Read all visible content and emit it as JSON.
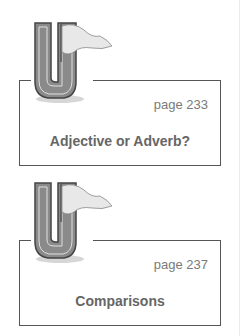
{
  "cards": [
    {
      "icon": "letter-u-flag-icon",
      "page": "page 233",
      "title": "Adjective or Adverb?"
    },
    {
      "icon": "letter-u-flag-icon",
      "page": "page 237",
      "title": "Comparisons"
    }
  ],
  "colors": {
    "border": "#555555",
    "text": "#666666",
    "letter_fill": "#8a8a8a"
  }
}
